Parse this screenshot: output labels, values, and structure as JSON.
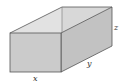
{
  "diagram": {
    "type": "open-top rectangular box",
    "labels": {
      "x": "x",
      "y": "y",
      "z": "z"
    },
    "colors": {
      "front_face": "#c8c8c8",
      "inner_back_face": "#d6d6d6",
      "inner_left_face": "#e0e0e0",
      "right_face": "#bdbdbd",
      "edge": "#555555"
    }
  }
}
